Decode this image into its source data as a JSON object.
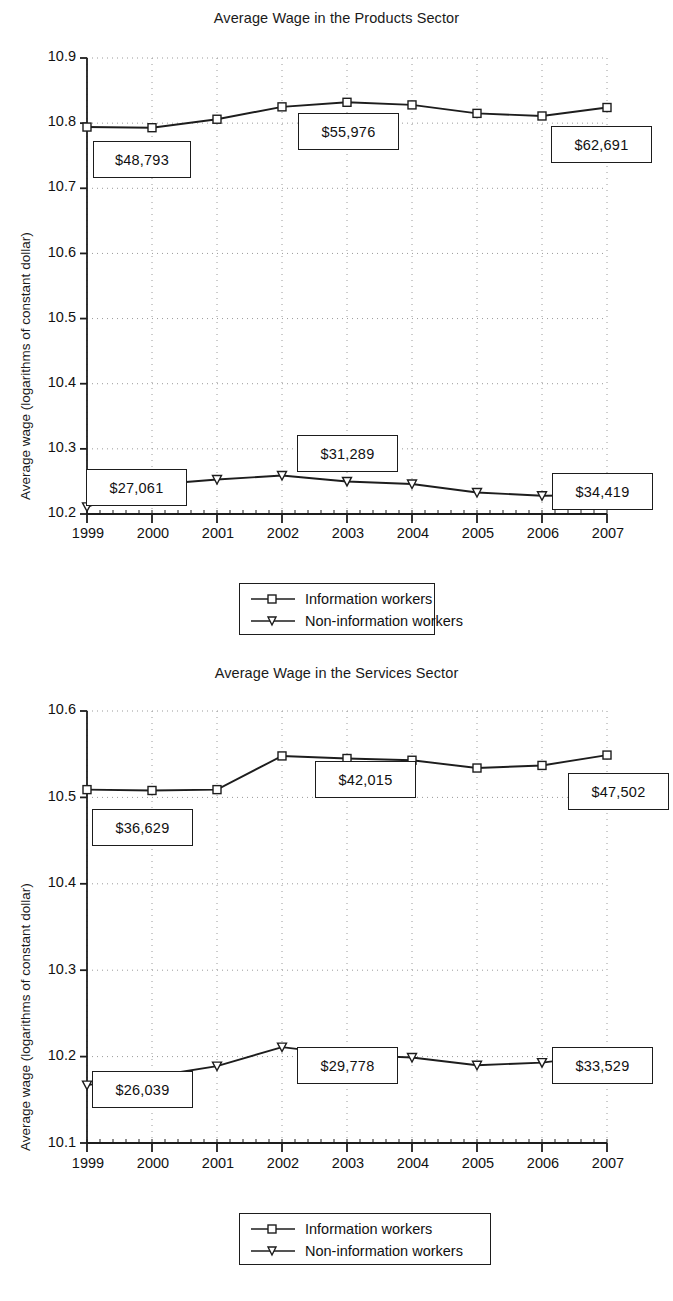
{
  "chart_data": [
    {
      "type": "line",
      "title": "Average Wage in the Products Sector",
      "xlabel": "",
      "ylabel": "Average wage (logarithms of constant dollar)",
      "x": [
        "1999",
        "2000",
        "2001",
        "2002",
        "2003",
        "2004",
        "2005",
        "2006",
        "2007"
      ],
      "ylim": [
        10.2,
        10.9
      ],
      "yticks": [
        "10.2",
        "10.3",
        "10.4",
        "10.5",
        "10.6",
        "10.7",
        "10.8",
        "10.9"
      ],
      "grid": true,
      "legend_position": "bottom",
      "series": [
        {
          "name": "Information workers",
          "marker": "square",
          "values": [
            10.794,
            10.793,
            10.806,
            10.825,
            10.832,
            10.828,
            10.815,
            10.811,
            10.824
          ]
        },
        {
          "name": "Non-information workers",
          "marker": "triangle-down",
          "values": [
            10.211,
            10.245,
            10.253,
            10.259,
            10.25,
            10.246,
            10.233,
            10.228,
            10.229
          ]
        }
      ],
      "annotations": [
        {
          "text": "$48,793",
          "series": "Information workers",
          "year": "1999"
        },
        {
          "text": "$55,976",
          "series": "Information workers",
          "year": "2003"
        },
        {
          "text": "$62,691",
          "series": "Information workers",
          "year": "2007"
        },
        {
          "text": "$27,061",
          "series": "Non-information workers",
          "year": "1999"
        },
        {
          "text": "$31,289",
          "series": "Non-information workers",
          "year": "2003"
        },
        {
          "text": "$34,419",
          "series": "Non-information workers",
          "year": "2007"
        }
      ]
    },
    {
      "type": "line",
      "title": "Average Wage in the Services Sector",
      "xlabel": "",
      "ylabel": "Average wage (logarithms of constant dollar)",
      "x": [
        "1999",
        "2000",
        "2001",
        "2002",
        "2003",
        "2004",
        "2005",
        "2006",
        "2007"
      ],
      "ylim": [
        10.1,
        10.6
      ],
      "yticks": [
        "10.1",
        "10.2",
        "10.3",
        "10.4",
        "10.5",
        "10.6"
      ],
      "grid": true,
      "legend_position": "bottom",
      "series": [
        {
          "name": "Information workers",
          "marker": "square",
          "values": [
            10.509,
            10.508,
            10.509,
            10.548,
            10.545,
            10.543,
            10.534,
            10.537,
            10.549
          ]
        },
        {
          "name": "Non-information workers",
          "marker": "triangle-down",
          "values": [
            10.167,
            10.177,
            10.189,
            10.211,
            10.202,
            10.199,
            10.19,
            10.193,
            10.202
          ]
        }
      ],
      "annotations": [
        {
          "text": "$36,629",
          "series": "Information workers",
          "year": "1999"
        },
        {
          "text": "$42,015",
          "series": "Information workers",
          "year": "2003"
        },
        {
          "text": "$47,502",
          "series": "Information workers",
          "year": "2007"
        },
        {
          "text": "$26,039",
          "series": "Non-information workers",
          "year": "1999"
        },
        {
          "text": "$29,778",
          "series": "Non-information workers",
          "year": "2003"
        },
        {
          "text": "$33,529",
          "series": "Non-information workers",
          "year": "2007"
        }
      ]
    }
  ],
  "fig1": {
    "title": "Average Wage in the Products Sector",
    "ylabel": "Average wage (logarithms of constant dollar)",
    "yticks": [
      "10.9",
      "10.8",
      "10.7",
      "10.6",
      "10.5",
      "10.4",
      "10.3",
      "10.2"
    ],
    "xticks": [
      "1999",
      "2000",
      "2001",
      "2002",
      "2003",
      "2004",
      "2005",
      "2006",
      "2007"
    ],
    "callouts": {
      "a": "$48,793",
      "b": "$55,976",
      "c": "$62,691",
      "d": "$27,061",
      "e": "$31,289",
      "f": "$34,419"
    },
    "legend": {
      "item1": "Information workers",
      "item2": "Non-information workers"
    }
  },
  "fig2": {
    "title": "Average Wage in the Services Sector",
    "ylabel": "Average wage (logarithms of constant dollar)",
    "yticks": [
      "10.6",
      "10.5",
      "10.4",
      "10.3",
      "10.2",
      "10.1"
    ],
    "xticks": [
      "1999",
      "2000",
      "2001",
      "2002",
      "2003",
      "2004",
      "2005",
      "2006",
      "2007"
    ],
    "callouts": {
      "a": "$36,629",
      "b": "$42,015",
      "c": "$47,502",
      "d": "$26,039",
      "e": "$29,778",
      "f": "$33,529"
    },
    "legend": {
      "item1": "Information workers",
      "item2": "Non-information workers"
    }
  },
  "colors": {
    "line": "#1d1d1d",
    "marker_fill": "#ffffff",
    "grid": "#9a9a9a",
    "text": "#111111"
  }
}
